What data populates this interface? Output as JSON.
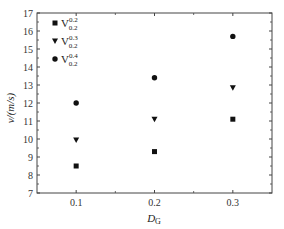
{
  "chart_data": {
    "type": "scatter",
    "title": "",
    "xlabel": "D_G",
    "xlabel_main": "D",
    "xlabel_sub": "G",
    "ylabel": "v/(m/s)",
    "xlim": [
      0.05,
      0.35
    ],
    "ylim": [
      7,
      17
    ],
    "x_ticks": [
      "0.1",
      "0.2",
      "0.3"
    ],
    "x_tick_values": [
      0.1,
      0.2,
      0.3
    ],
    "y_ticks": [
      "7",
      "8",
      "9",
      "10",
      "11",
      "12",
      "13",
      "14",
      "15",
      "16",
      "17"
    ],
    "y_tick_values": [
      7,
      8,
      9,
      10,
      11,
      12,
      13,
      14,
      15,
      16,
      17
    ],
    "grid": false,
    "legend_position": "upper left",
    "x": [
      0.1,
      0.2,
      0.3
    ],
    "series": [
      {
        "name": "V_{0.2}^{0.2}",
        "base": "V",
        "sup": "0.2",
        "sub": "0.2",
        "marker": "square",
        "values": [
          8.5,
          9.3,
          11.1
        ]
      },
      {
        "name": "V_{0.2}^{0.3}",
        "base": "V",
        "sup": "0.3",
        "sub": "0.2",
        "marker": "triangle-down",
        "values": [
          9.95,
          11.1,
          12.85
        ]
      },
      {
        "name": "V_{0.2}^{0.4}",
        "base": "V",
        "sup": "0.4",
        "sub": "0.2",
        "marker": "circle",
        "values": [
          12.0,
          13.4,
          15.7
        ]
      }
    ]
  }
}
